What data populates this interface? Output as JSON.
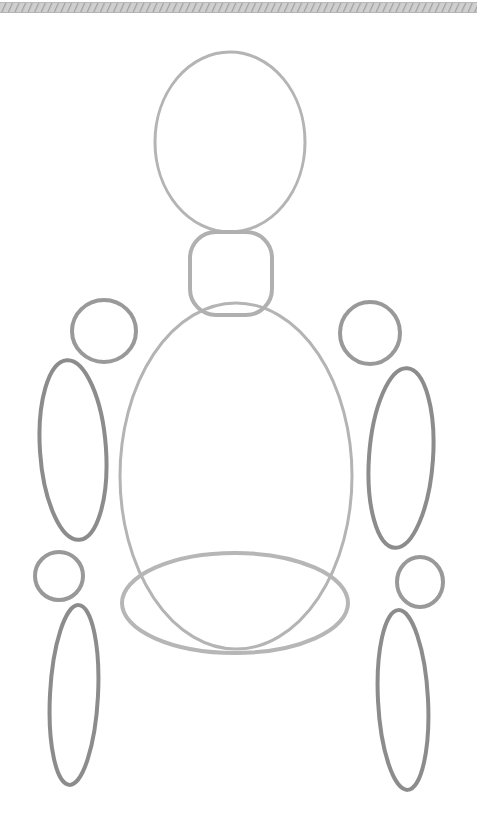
{
  "page": {
    "width": 477,
    "height": 825,
    "background_color": "#ffffff"
  },
  "palette": {
    "background": "#ffffff",
    "stroke_light": "#b4b4b4",
    "stroke_mid": "#a8a8a8",
    "stroke_dark": "#8c8c8c",
    "band_gray": "#a9a9a9",
    "band_gray_light": "#cfcfcf"
  },
  "top_band": {
    "name": "hatched top band",
    "pattern": "diagonal-hatch",
    "x": 0,
    "y": 2,
    "width": 477,
    "height": 11,
    "color": "#a9a9a9"
  },
  "shapes": [
    {
      "id": "head",
      "label": "Head",
      "type": "ellipse",
      "cx": 230,
      "cy": 142,
      "rx": 75,
      "ry": 90,
      "rotation": 0,
      "stroke": "#b4b4b4",
      "stroke_width": 3
    },
    {
      "id": "neck",
      "label": "Neck",
      "type": "rounded-rect",
      "x": 190,
      "y": 232,
      "width": 82,
      "height": 83,
      "radius": 26,
      "rotation": 0,
      "stroke": "#b0b0b0",
      "stroke_width": 4
    },
    {
      "id": "torso",
      "label": "Torso / ribcage",
      "type": "ellipse",
      "cx": 236,
      "cy": 476,
      "rx": 116,
      "ry": 173,
      "rotation": 0,
      "stroke": "#b4b4b4",
      "stroke_width": 3
    },
    {
      "id": "hips",
      "label": "Hips / pelvis",
      "type": "ellipse",
      "cx": 235,
      "cy": 603,
      "rx": 113,
      "ry": 50,
      "rotation": 0,
      "stroke": "#b6b6b6",
      "stroke_width": 4
    },
    {
      "id": "shoulder-left",
      "label": "Left shoulder joint",
      "type": "ellipse",
      "cx": 104,
      "cy": 331,
      "rx": 32,
      "ry": 31,
      "rotation": 0,
      "stroke": "#999999",
      "stroke_width": 4
    },
    {
      "id": "upperarm-left",
      "label": "Left upper arm",
      "type": "ellipse",
      "cx": 73,
      "cy": 450,
      "rx": 33,
      "ry": 90,
      "rotation": -4,
      "stroke": "#8c8c8c",
      "stroke_width": 4
    },
    {
      "id": "elbow-left",
      "label": "Left elbow joint",
      "type": "ellipse",
      "cx": 59,
      "cy": 576,
      "rx": 24,
      "ry": 24,
      "rotation": 0,
      "stroke": "#999999",
      "stroke_width": 4
    },
    {
      "id": "forearm-left",
      "label": "Left forearm",
      "type": "ellipse",
      "cx": 74,
      "cy": 695,
      "rx": 24,
      "ry": 90,
      "rotation": 3,
      "stroke": "#8c8c8c",
      "stroke_width": 4
    },
    {
      "id": "shoulder-right",
      "label": "Right shoulder joint",
      "type": "ellipse",
      "cx": 370,
      "cy": 333,
      "rx": 30,
      "ry": 31,
      "rotation": 0,
      "stroke": "#999999",
      "stroke_width": 4
    },
    {
      "id": "upperarm-right",
      "label": "Right upper arm",
      "type": "ellipse",
      "cx": 401,
      "cy": 458,
      "rx": 32,
      "ry": 90,
      "rotation": 4,
      "stroke": "#8c8c8c",
      "stroke_width": 4
    },
    {
      "id": "elbow-right",
      "label": "Right elbow joint",
      "type": "ellipse",
      "cx": 420,
      "cy": 582,
      "rx": 23,
      "ry": 25,
      "rotation": 0,
      "stroke": "#999999",
      "stroke_width": 4
    },
    {
      "id": "forearm-right",
      "label": "Right forearm",
      "type": "ellipse",
      "cx": 403,
      "cy": 700,
      "rx": 25,
      "ry": 90,
      "rotation": -3,
      "stroke": "#8c8c8c",
      "stroke_width": 4
    }
  ]
}
